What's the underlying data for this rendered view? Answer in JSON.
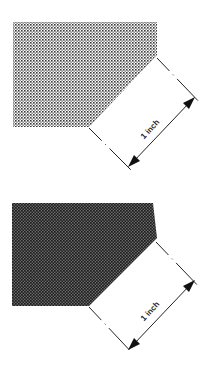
{
  "figures": [
    {
      "id": "screen-light",
      "description": "Halftone dot pattern, lighter screen",
      "fill_color": "#3a3a3a",
      "dot_pitch": 3,
      "dot_size": 1.6,
      "dimension_label": "1 inch"
    },
    {
      "id": "screen-dark",
      "description": "Halftone dot pattern, darker screen",
      "fill_color": "#1e1e1e",
      "dot_pitch": 3,
      "dot_size": 2.2,
      "dimension_label": "1 inch"
    }
  ],
  "colors": {
    "background": "#ffffff",
    "line": "#222222"
  }
}
